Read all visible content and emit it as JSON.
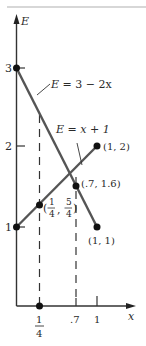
{
  "diagram": {
    "axes": {
      "y_label": "E",
      "x_label": "x",
      "y_ticks": [
        "1",
        "2",
        "3"
      ],
      "x_ticks": {
        "quarter_num": "1",
        "quarter_den": "4",
        "seven": ".7",
        "one": "1"
      }
    },
    "lines": [
      {
        "name": "E = 3 - 2x",
        "label_lhs": "E",
        "label_rhs": "3 − 2x",
        "from": [
          0,
          3
        ],
        "to": [
          1,
          1
        ]
      },
      {
        "name": "E = x + 1",
        "label_lhs": "E",
        "label_rhs": "x + 1",
        "from": [
          0,
          1
        ],
        "to": [
          1,
          2
        ]
      }
    ],
    "points": {
      "p12": "(1, 2)",
      "p11": "(1, 1)",
      "p716": "(.7, 1.6)",
      "quarter_open": "(",
      "quarter_x_num": "1",
      "quarter_x_den": "4",
      "quarter_comma": ",",
      "quarter_y_num": "5",
      "quarter_y_den": "4",
      "quarter_close": ")"
    },
    "colors": {
      "line": "#555555",
      "axis": "#333333",
      "rule": "#b0b0b0"
    }
  }
}
